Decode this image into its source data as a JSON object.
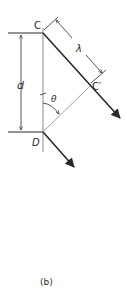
{
  "figure": {
    "caption": "(b)",
    "points": {
      "C": "C",
      "C_prime": "C′",
      "D": "D"
    },
    "symbols": {
      "separation": "d",
      "wavelength": "λ",
      "angle": "θ"
    },
    "colors": {
      "line": "#2a2a2a",
      "light_line": "#9a9a9a",
      "background": "#ffffff"
    }
  }
}
